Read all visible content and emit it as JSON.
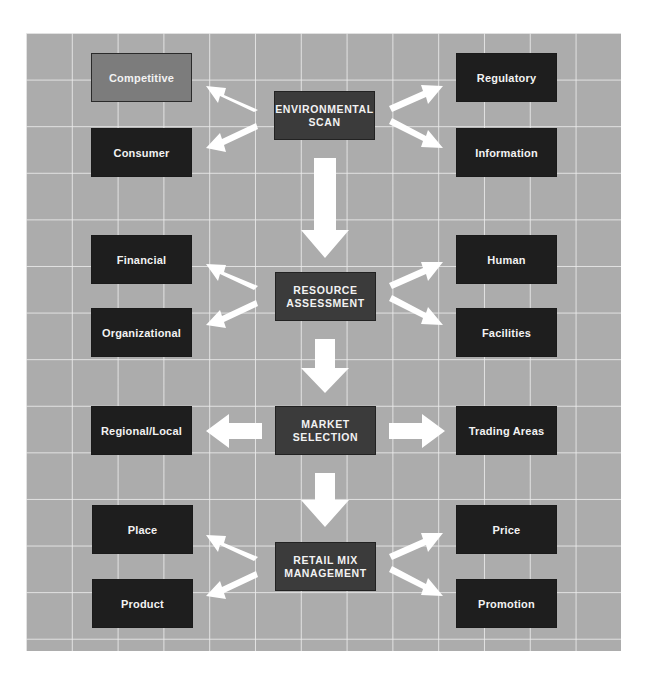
{
  "diagram": {
    "colors": {
      "background": "#acacac",
      "grid_lines": "#ebebeb",
      "side_box": "#1e1e1e",
      "highlight_box": "#7c7c7c",
      "center_box": "#3b3b3b",
      "arrows": "#ffffff",
      "text": "#f2f2f2"
    },
    "stages": [
      {
        "center": "ENVIRONMENTAL SCAN",
        "center_lines": [
          "ENVIRONMENTAL",
          "SCAN"
        ],
        "left": [
          "Competitive",
          "Consumer"
        ],
        "right": [
          "Regulatory",
          "Information"
        ],
        "highlighted": "Competitive"
      },
      {
        "center": "RESOURCE ASSESSMENT",
        "center_lines": [
          "RESOURCE",
          "ASSESSMENT"
        ],
        "left": [
          "Financial",
          "Organizational"
        ],
        "right": [
          "Human",
          "Facilities"
        ]
      },
      {
        "center": "MARKET SELECTION",
        "center_lines": [
          "MARKET",
          "SELECTION"
        ],
        "left": [
          "Regional/Local"
        ],
        "right": [
          "Trading Areas"
        ]
      },
      {
        "center": "RETAIL MIX MANAGEMENT",
        "center_lines": [
          "RETAIL MIX",
          "MANAGEMENT"
        ],
        "left": [
          "Place",
          "Product"
        ],
        "right": [
          "Price",
          "Promotion"
        ]
      }
    ]
  }
}
